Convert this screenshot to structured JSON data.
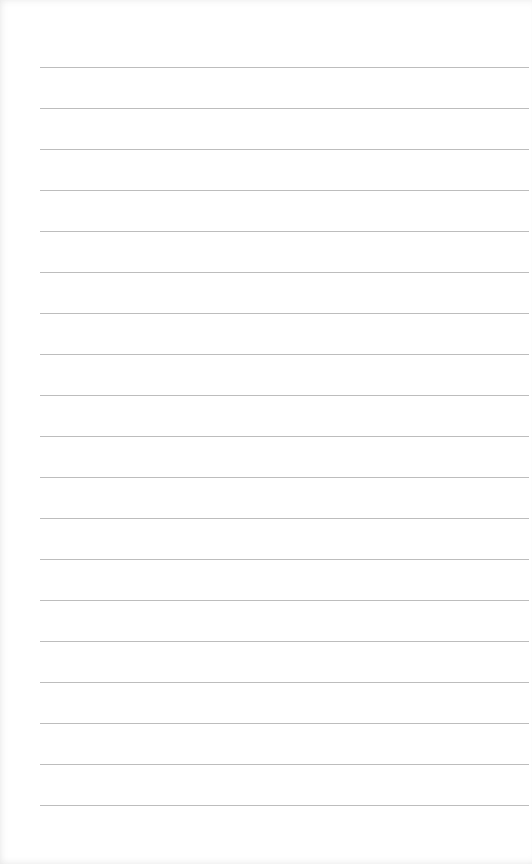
{
  "paper": {
    "type": "lined-notepad",
    "line_color": "#bdbdbd",
    "background": "#ffffff",
    "line_count": 19,
    "first_line_y": 67,
    "line_spacing": 41
  }
}
